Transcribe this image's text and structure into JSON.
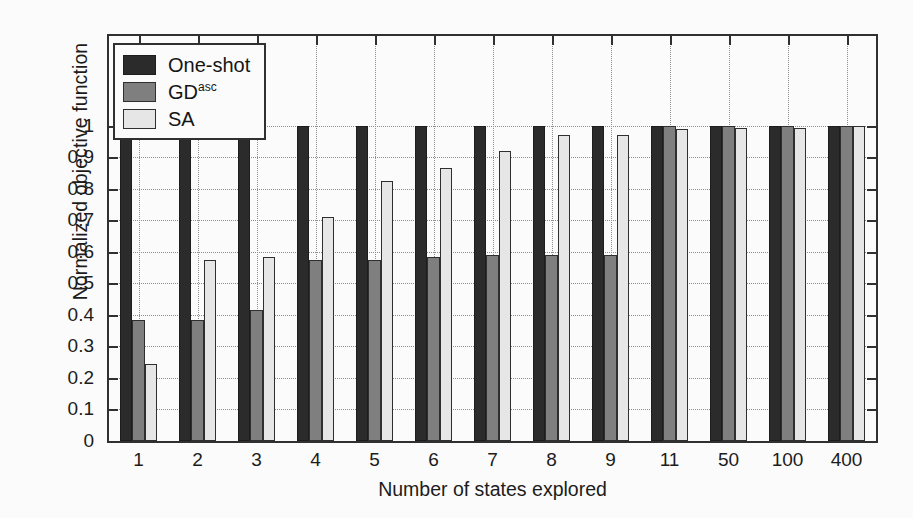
{
  "chart_data": {
    "type": "bar",
    "title": "",
    "xlabel": "Number of states explored",
    "ylabel": "Normalized objective function",
    "ylim": [
      0,
      1
    ],
    "yticks": [
      "0",
      "0.1",
      "0.2",
      "0.3",
      "0.4",
      "0.5",
      "0.6",
      "0.7",
      "0.8",
      "0.9",
      "1"
    ],
    "ytick_values": [
      0,
      0.1,
      0.2,
      0.3,
      0.4,
      0.5,
      0.6,
      0.7,
      0.8,
      0.9,
      1
    ],
    "grid": true,
    "legend_position": "upper-left",
    "categories": [
      "1",
      "2",
      "3",
      "4",
      "5",
      "6",
      "7",
      "8",
      "9",
      "11",
      "50",
      "100",
      "400"
    ],
    "series": [
      {
        "name": "One-shot",
        "color": "#2b2b2b",
        "values": [
          1.0,
          1.0,
          1.0,
          1.0,
          1.0,
          1.0,
          1.0,
          1.0,
          1.0,
          1.0,
          1.0,
          1.0,
          1.0
        ]
      },
      {
        "name": "GD",
        "name_sup": "asc",
        "color": "#7f7f7f",
        "values": [
          0.385,
          0.385,
          0.415,
          0.575,
          0.575,
          0.585,
          0.59,
          0.59,
          0.59,
          1.0,
          1.0,
          1.0,
          1.0
        ]
      },
      {
        "name": "SA",
        "color": "#e6e6e6",
        "values": [
          0.245,
          0.575,
          0.585,
          0.71,
          0.825,
          0.865,
          0.92,
          0.97,
          0.97,
          0.99,
          0.995,
          0.995,
          1.0
        ]
      }
    ]
  },
  "legend": {
    "items": [
      {
        "label": "One-shot",
        "sup": "",
        "swatch": "oneshot"
      },
      {
        "label": "GD",
        "sup": "asc",
        "swatch": "gd"
      },
      {
        "label": "SA",
        "sup": "",
        "swatch": "sa"
      }
    ]
  }
}
